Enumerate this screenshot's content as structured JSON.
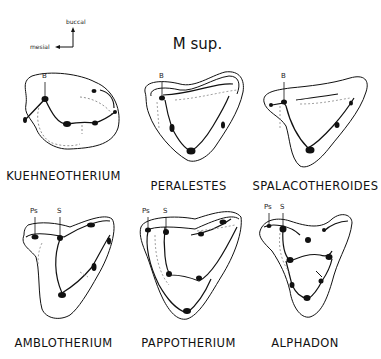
{
  "orientation": {
    "buccal_label": "buccal",
    "mesial_label": "mesial"
  },
  "title": "M sup.",
  "panels": [
    {
      "taxon": "KUEHNEOTHERIUM",
      "cusp_labels": [
        "B"
      ]
    },
    {
      "taxon": "PERALESTES",
      "cusp_labels": [
        "B"
      ]
    },
    {
      "taxon": "SPALACOTHEROIDES",
      "cusp_labels": [
        "B"
      ]
    },
    {
      "taxon": "AMBLOTHERIUM",
      "cusp_labels": [
        "Ps",
        "S"
      ]
    },
    {
      "taxon": "PAPPOTHERIUM",
      "cusp_labels": [
        "Ps",
        "S"
      ]
    },
    {
      "taxon": "ALPHADON",
      "cusp_labels": [
        "Ps",
        "S"
      ]
    }
  ]
}
